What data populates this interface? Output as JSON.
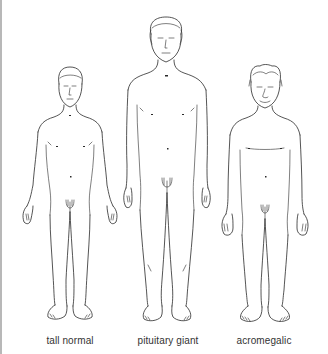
{
  "figure": {
    "labels": {
      "left": "tall normal",
      "center": "pituitary giant",
      "right": "acromegalic"
    },
    "colors": {
      "line": "#2a2a2a",
      "label": "#333333",
      "background": "#ffffff",
      "border": "#b8b8b8"
    }
  }
}
